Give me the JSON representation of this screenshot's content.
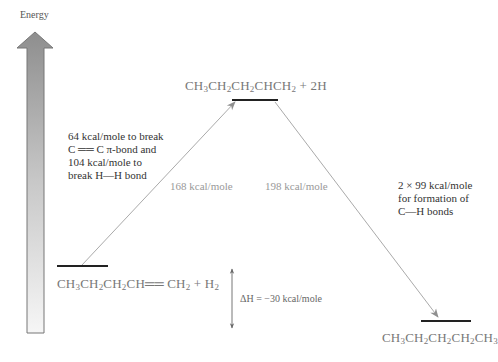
{
  "diagram": {
    "type": "energy-level-diagram",
    "axis_label": "Energy",
    "levels": [
      {
        "id": "reactants",
        "formula_parts": [
          "CH",
          "3",
          "CH",
          "2",
          "CH",
          "2",
          "CH",
          "",
          "= CH",
          "2",
          " + H",
          "2"
        ],
        "formula": "CH3CH2CH2CH=CH2 + H2"
      },
      {
        "id": "intermediate",
        "formula": "CH3CH2CH2CHCH2 + 2H"
      },
      {
        "id": "product",
        "formula": "CH3CH2CH2CH2CH3"
      }
    ],
    "transitions": [
      {
        "from": "reactants",
        "to": "intermediate",
        "value_label": "168 kcal/mole",
        "note_lines": [
          "64 kcal/mole to break",
          "C ══ C π-bond and",
          "104 kcal/mole to",
          "break H—H bond"
        ]
      },
      {
        "from": "intermediate",
        "to": "product",
        "value_label": "198 kcal/mole",
        "note_lines": [
          "2 × 99 kcal/mole",
          "for formation of",
          "C—H bonds"
        ]
      }
    ],
    "delta_h": {
      "label": "ΔH = −30 kcal/mole"
    }
  },
  "text": {
    "energy": "Energy",
    "note_left": "64 kcal/mole to break\nC ══ C π-bond and\n104 kcal/mole to\nbreak H—H bond",
    "note_right": "2 × 99 kcal/mole\nfor formation of\nC—H bonds",
    "up_value": "168 kcal/mole",
    "down_value": "198 kcal/mole",
    "delta_h": "ΔH = −30 kcal/mole"
  },
  "formulas": {
    "intermediate": [
      {
        "t": "CH"
      },
      {
        "s": "3"
      },
      {
        "t": "CH"
      },
      {
        "s": "2"
      },
      {
        "t": "CH"
      },
      {
        "s": "2"
      },
      {
        "t": "CHCH"
      },
      {
        "s": "2"
      },
      {
        "t": " + 2H"
      }
    ],
    "reactants": [
      {
        "t": "CH"
      },
      {
        "s": "3"
      },
      {
        "t": "CH"
      },
      {
        "s": "2"
      },
      {
        "t": "CH"
      },
      {
        "s": "2"
      },
      {
        "t": "CH══ CH"
      },
      {
        "s": "2"
      },
      {
        "t": " + H"
      },
      {
        "s": "2"
      }
    ],
    "product": [
      {
        "t": "CH"
      },
      {
        "s": "3"
      },
      {
        "t": "CH"
      },
      {
        "s": "2"
      },
      {
        "t": "CH"
      },
      {
        "s": "2"
      },
      {
        "t": "CH"
      },
      {
        "s": "2"
      },
      {
        "t": "CH"
      },
      {
        "s": "3"
      }
    ]
  },
  "colors": {
    "level_bar": "#222222",
    "arrow": "#999999",
    "energy_arrow_fill": "#9a9a9a",
    "energy_arrow_fill_light": "#f2f2f2"
  }
}
